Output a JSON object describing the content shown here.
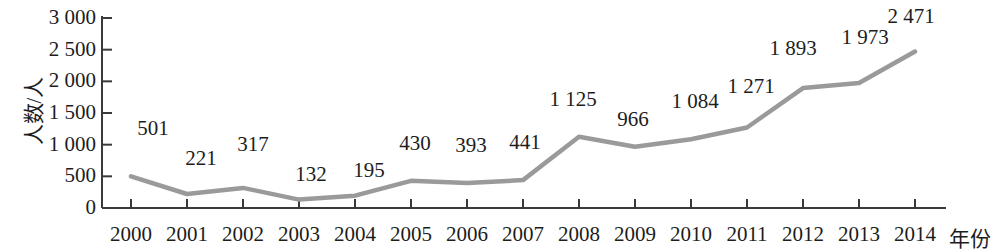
{
  "chart_data": {
    "type": "line",
    "title": "",
    "xlabel": "年份",
    "ylabel": "人数/人",
    "categories": [
      "2000",
      "2001",
      "2002",
      "2003",
      "2004",
      "2005",
      "2006",
      "2007",
      "2008",
      "2009",
      "2010",
      "2011",
      "2012",
      "2013",
      "2014"
    ],
    "values": [
      501,
      221,
      317,
      132,
      195,
      430,
      393,
      441,
      1125,
      966,
      1084,
      1271,
      1893,
      1973,
      2471
    ],
    "point_labels": [
      "501",
      "221",
      "317",
      "132",
      "195",
      "430",
      "393",
      "441",
      "1 125",
      "966",
      "1 084",
      "1 271",
      "1 893",
      "1 973",
      "2 471"
    ],
    "ylim": [
      0,
      3000
    ],
    "yticks": [
      0,
      500,
      1000,
      1500,
      2000,
      2500,
      3000
    ],
    "ytick_labels": [
      "0",
      "500",
      "1 000",
      "1 500",
      "2 000",
      "2 500",
      "3 000"
    ],
    "grid": false,
    "legend": null,
    "series": [
      {
        "name": "人数/人",
        "values": [
          501,
          221,
          317,
          132,
          195,
          430,
          393,
          441,
          1125,
          966,
          1084,
          1271,
          1893,
          1973,
          2471
        ],
        "color": "#9a9a9a"
      }
    ],
    "colors": {
      "line": "#9a9a9a",
      "axis": "#3a3a3a",
      "text": "#1d1d1d",
      "background": "#ffffff"
    }
  }
}
